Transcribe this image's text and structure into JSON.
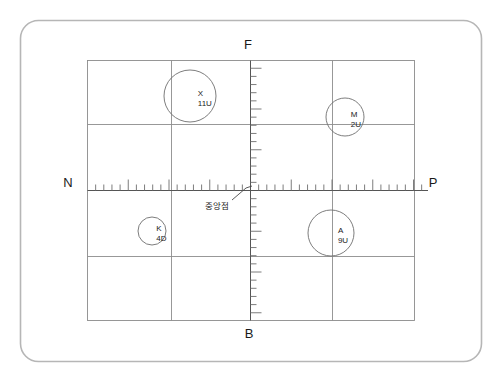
{
  "diagram": {
    "title_visible": false,
    "frame": {
      "name": "rounded-outer-frame",
      "color": "#b6b6b6"
    },
    "grid": {
      "color": "#8c8c8c",
      "columns": 4,
      "rows": 4
    },
    "axis_labels": {
      "top": "F",
      "bottom": "B",
      "left": "N",
      "right": "P"
    },
    "annotation": {
      "text": "중앙점",
      "leader": "line-to-origin"
    },
    "markers": [
      {
        "id": "marker-x",
        "label": "X",
        "value": "11U",
        "cx": 190,
        "cy": 96,
        "r": 26
      },
      {
        "id": "marker-m",
        "label": "M",
        "value": "2U",
        "cx": 345,
        "cy": 117,
        "r": 19
      },
      {
        "id": "marker-k",
        "label": "K",
        "value": "4D",
        "cx": 152,
        "cy": 231,
        "r": 14
      },
      {
        "id": "marker-a",
        "label": "A",
        "value": "9U",
        "cx": 331,
        "cy": 233,
        "r": 23
      }
    ],
    "ruler": {
      "horizontal": {
        "name": "horizontal-ruler",
        "tick_color": "#6e6e6e"
      },
      "vertical": {
        "name": "vertical-ruler",
        "tick_color": "#6e6e6e"
      }
    }
  }
}
